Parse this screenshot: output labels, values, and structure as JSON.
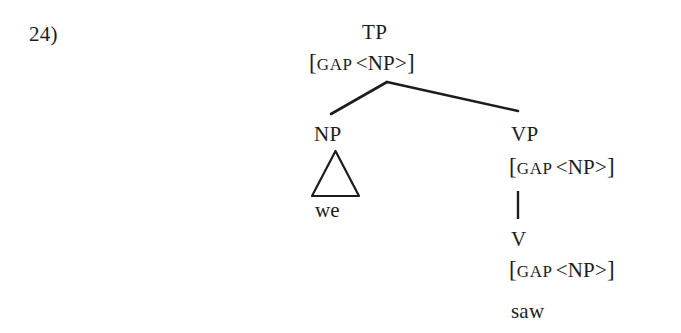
{
  "example": {
    "number_label": "24)"
  },
  "tree": {
    "root": {
      "category": "TP",
      "feature": {
        "open_bracket": "[",
        "feature_name": "GAP",
        "value": "<NP>",
        "close_bracket": "]",
        "full_text": "[GAP <NP>]"
      }
    },
    "subject": {
      "category": "NP",
      "triangle": "triangle-abbreviation",
      "terminal": "we"
    },
    "predicate": {
      "category": "VP",
      "feature": {
        "open_bracket": "[",
        "feature_name": "GAP",
        "value": "<NP>",
        "close_bracket": "]",
        "full_text": "[GAP <NP>]"
      },
      "child": {
        "category": "V",
        "feature": {
          "open_bracket": "[",
          "feature_name": "GAP",
          "value": "<NP>",
          "close_bracket": "]",
          "full_text": "[GAP <NP>]"
        },
        "terminal": "saw"
      }
    }
  },
  "colors": {
    "ink": "#1c1c1c",
    "paper": "#ffffff"
  }
}
